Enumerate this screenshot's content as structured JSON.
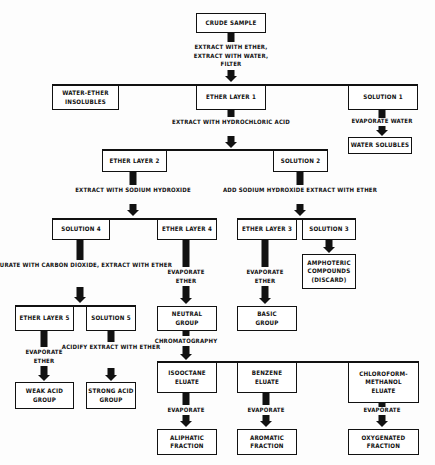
{
  "diagram": {
    "type": "flowchart",
    "nodes": {
      "crude_sample": "CRUDE SAMPLE",
      "water_ether_insolubles": "WATER-ETHER\nINSOLUBLES",
      "ether_layer_1": "ETHER LAYER 1",
      "solution_1": "SOLUTION 1",
      "water_solubles": "WATER SOLUBLES",
      "ether_layer_2": "ETHER LAYER 2",
      "solution_2": "SOLUTION 2",
      "solution_4": "SOLUTION 4",
      "ether_layer_4": "ETHER LAYER 4",
      "ether_layer_3": "ETHER LAYER 3",
      "solution_3": "SOLUTION 3",
      "amphoteric": "AMPHOTERIC\nCOMPOUNDS\n(DISCARD)",
      "ether_layer_5": "ETHER LAYER 5",
      "solution_5": "SOLUTION 5",
      "neutral_group": "NEUTRAL\nGROUP",
      "basic_group": "BASIC\nGROUP",
      "weak_acid_group": "WEAK ACID\nGROUP",
      "strong_acid_group": "STRONG ACID\nGROUP",
      "isooctane_eluate": "ISOOCTANE\nELUATE",
      "benzene_eluate": "BENZENE\nELUATE",
      "chloroform_methanol_eluate": "CHLOROFORM-\nMETHANOL\nELUATE",
      "aliphatic_fraction": "ALIPHATIC\nFRACTION",
      "aromatic_fraction": "AROMATIC\nFRACTION",
      "oxygenated_fraction": "OXYGENATED\nFRACTION"
    },
    "steps": {
      "step_1": "EXTRACT WITH ETHER,\nEXTRACT WITH WATER,\nFILTER",
      "step_hcl": "EXTRACT WITH\nHYDROCHLORIC ACID",
      "step_evap_water": "EVAPORATE WATER",
      "step_naoh": "EXTRACT WITH\nSODIUM HYDROXIDE",
      "step_add_naoh": "ADD SODIUM HYDROXIDE\nEXTRACT WITH ETHER",
      "step_co2": "SATURATE WITH\nCARBON DIOXIDE,\nEXTRACT WITH ETHER",
      "step_evap_ether_4": "EVAPORATE\nETHER",
      "step_evap_ether_3": "EVAPORATE\nETHER",
      "step_evap_ether_5": "EVAPORATE\nETHER",
      "step_acidify": "ACIDIFY\nEXTRACT WITH\nETHER",
      "step_chromatography": "CHROMATOGRAPHY",
      "step_evap_iso": "EVAPORATE",
      "step_evap_benz": "EVAPORATE",
      "step_evap_chloro": "EVAPORATE"
    },
    "edges": [
      [
        "crude_sample",
        "ether_layer_1"
      ],
      [
        "crude_sample",
        "water_ether_insolubles"
      ],
      [
        "crude_sample",
        "solution_1"
      ],
      [
        "solution_1",
        "water_solubles"
      ],
      [
        "ether_layer_1",
        "ether_layer_2"
      ],
      [
        "ether_layer_1",
        "solution_2"
      ],
      [
        "ether_layer_2",
        "solution_4"
      ],
      [
        "ether_layer_2",
        "ether_layer_4"
      ],
      [
        "solution_2",
        "ether_layer_3"
      ],
      [
        "solution_2",
        "solution_3"
      ],
      [
        "solution_3",
        "amphoteric"
      ],
      [
        "solution_4",
        "ether_layer_5"
      ],
      [
        "solution_4",
        "solution_5"
      ],
      [
        "ether_layer_4",
        "neutral_group"
      ],
      [
        "ether_layer_3",
        "basic_group"
      ],
      [
        "ether_layer_5",
        "weak_acid_group"
      ],
      [
        "solution_5",
        "strong_acid_group"
      ],
      [
        "neutral_group",
        "isooctane_eluate"
      ],
      [
        "neutral_group",
        "benzene_eluate"
      ],
      [
        "neutral_group",
        "chloroform_methanol_eluate"
      ],
      [
        "isooctane_eluate",
        "aliphatic_fraction"
      ],
      [
        "benzene_eluate",
        "aromatic_fraction"
      ],
      [
        "chloroform_methanol_eluate",
        "oxygenated_fraction"
      ]
    ]
  }
}
